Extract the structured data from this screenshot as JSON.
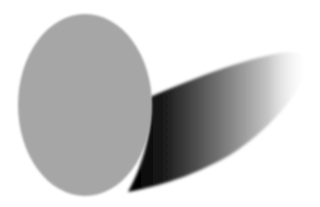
{
  "scene": {
    "description": "Gray elliptical disk casting a gradient shadow to the right",
    "disk": {
      "cx": 85,
      "cy": 105,
      "rx": 67,
      "ry": 91,
      "color": "#a6a6a6"
    },
    "shadow": {
      "dark_color": "#0a0a0a",
      "mid_color": "#8c8c8c",
      "light_color": "#ffffff"
    },
    "background": "#ffffff"
  }
}
